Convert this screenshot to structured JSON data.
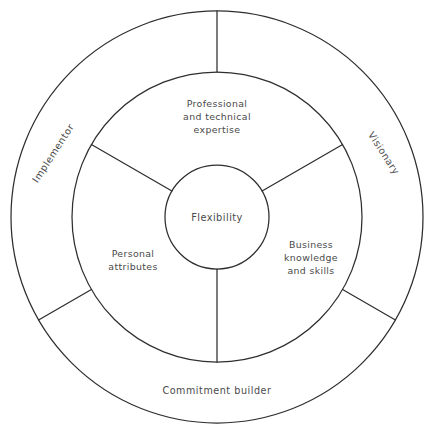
{
  "diagram": {
    "type": "concentric-wheel",
    "core": {
      "label": "Flexibility"
    },
    "inner_ring": {
      "segment_count": 3,
      "segments": [
        {
          "id": "professional-technical-expertise",
          "label": "Professional and technical expertise",
          "lines": [
            "Professional",
            "and technical",
            "expertise"
          ],
          "position": "top"
        },
        {
          "id": "business-knowledge-and-skills",
          "label": "Business knowledge and skills",
          "lines": [
            "Business",
            "knowledge",
            "and skills"
          ],
          "position": "bottom-right"
        },
        {
          "id": "personal-attributes",
          "label": "Personal attributes",
          "lines": [
            "Personal",
            "attributes"
          ],
          "position": "bottom-left"
        }
      ]
    },
    "outer_ring": {
      "segment_count": 3,
      "segments": [
        {
          "id": "implementor",
          "label": "Implementor",
          "position": "upper-left",
          "orientation": "rotated"
        },
        {
          "id": "visionary",
          "label": "Visionary",
          "position": "upper-right",
          "orientation": "rotated"
        },
        {
          "id": "commitment-builder",
          "label": "Commitment builder",
          "position": "bottom",
          "orientation": "horizontal"
        }
      ]
    },
    "colors": {
      "stroke": "#2e2e2e",
      "text": "#4a4a4a",
      "background": "#ffffff"
    }
  }
}
